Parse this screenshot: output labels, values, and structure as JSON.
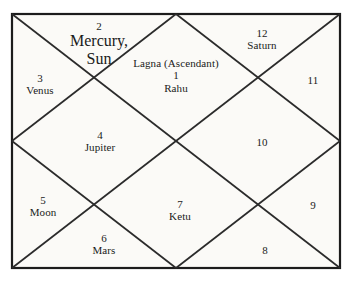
{
  "chart": {
    "type": "north-indian-vedic-birth-chart",
    "title": "",
    "frame_color": "#1c1c1c",
    "line_color": "#2b2b2b",
    "background_color": "#fbfaf7",
    "text_color": "#1a1a1a",
    "ascendant_label": "Lagna (Ascendant)",
    "houses": [
      {
        "number": "1",
        "title": "Lagna (Ascendant)",
        "planets": [
          "Rahu"
        ],
        "position": "top-center-diamond"
      },
      {
        "number": "2",
        "title": "",
        "planets": [
          "Mercury,",
          "Sun"
        ],
        "position": "top-left-triangle"
      },
      {
        "number": "3",
        "title": "",
        "planets": [
          "Venus"
        ],
        "position": "left-upper-triangle"
      },
      {
        "number": "4",
        "title": "",
        "planets": [
          "Jupiter"
        ],
        "position": "left-center-diamond"
      },
      {
        "number": "5",
        "title": "",
        "planets": [
          "Moon"
        ],
        "position": "left-lower-triangle"
      },
      {
        "number": "6",
        "title": "",
        "planets": [
          "Mars"
        ],
        "position": "bottom-left-triangle"
      },
      {
        "number": "7",
        "title": "",
        "planets": [
          "Ketu"
        ],
        "position": "bottom-center-diamond"
      },
      {
        "number": "8",
        "title": "",
        "planets": [],
        "position": "bottom-right-triangle"
      },
      {
        "number": "9",
        "title": "",
        "planets": [],
        "position": "right-lower-triangle"
      },
      {
        "number": "10",
        "title": "",
        "planets": [],
        "position": "right-center-diamond"
      },
      {
        "number": "11",
        "title": "",
        "planets": [],
        "position": "right-upper-triangle"
      },
      {
        "number": "12",
        "title": "",
        "planets": [
          "Saturn"
        ],
        "position": "top-right-triangle"
      }
    ]
  }
}
